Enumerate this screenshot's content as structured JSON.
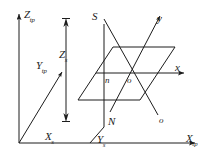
{
  "figure": {
    "kind": "3d-coordinate-diagram",
    "background_color": "#ffffff",
    "line_color": "#1c1c1c",
    "label_color": "#1c1c1c"
  },
  "axes": {
    "z_tp": {
      "label_base": "Z",
      "label_sub": "tp",
      "full": "Ztp"
    },
    "x_tp": {
      "label_base": "X",
      "label_sub": "tp",
      "full": "Xtp"
    },
    "y_tp": {
      "label_base": "Y",
      "label_sub": "tp",
      "full": "Ytp"
    },
    "x_local": {
      "label_base": "x",
      "label_sub": "",
      "full": "x"
    },
    "y_local": {
      "label_base": "y",
      "label_sub": "",
      "full": "y"
    }
  },
  "dimensions": {
    "z_s": {
      "label_base": "Z",
      "label_sub": "s",
      "full": "Zs"
    },
    "x_s": {
      "label_base": "X",
      "label_sub": "s",
      "full": "Xs"
    },
    "y_s": {
      "label_base": "Y",
      "label_sub": "s",
      "full": "Ys"
    }
  },
  "points": {
    "s_upper": {
      "label_base": "S",
      "label_sub": "",
      "full": "S"
    },
    "n_upper": {
      "label_base": "N",
      "label_sub": "",
      "full": "N"
    },
    "n_lower": {
      "label_base": "n",
      "label_sub": "",
      "full": "n"
    },
    "o_origin": {
      "label_base": "o",
      "label_sub": "",
      "full": "o"
    },
    "o_lower": {
      "label_base": "o",
      "label_sub": "",
      "full": "o"
    }
  }
}
